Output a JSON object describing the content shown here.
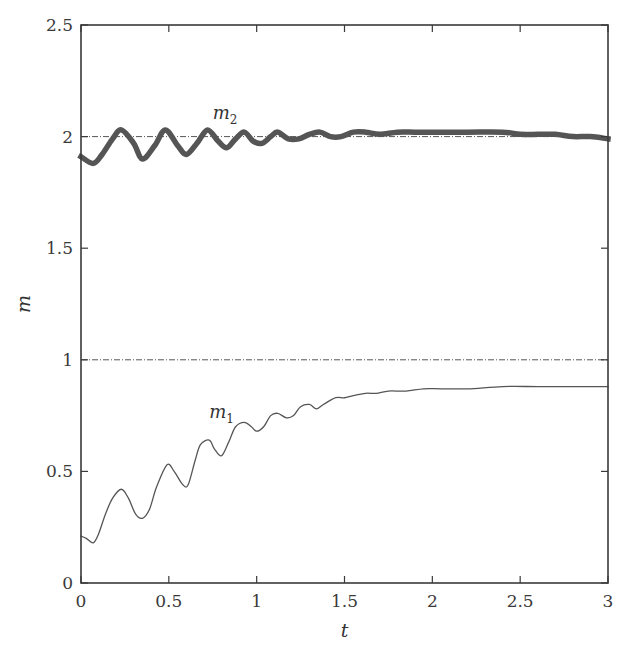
{
  "chart_data": {
    "type": "line",
    "title": "",
    "xlabel": "t",
    "ylabel": "m",
    "xlim": [
      0,
      3
    ],
    "ylim": [
      0,
      2.5
    ],
    "xticks": [
      0,
      0.5,
      1,
      1.5,
      2,
      2.5,
      3
    ],
    "xtick_labels": [
      "0",
      "0.5",
      "1",
      "1.5",
      "2",
      "2.5",
      "3"
    ],
    "yticks": [
      0,
      0.5,
      1,
      1.5,
      2,
      2.5
    ],
    "ytick_labels": [
      "0",
      "0.5",
      "1",
      "1.5",
      "2",
      "2.5"
    ],
    "grid": false,
    "legend": "none (inline series labels)",
    "reference_lines": [
      {
        "y": 2,
        "style": "dash-dot",
        "color": "#555555"
      },
      {
        "y": 1,
        "style": "dash-dot",
        "color": "#555555"
      }
    ],
    "series": [
      {
        "name": "m2",
        "label_main": "m",
        "label_sub": "2",
        "label_pos": {
          "t": 0.75,
          "m": 2.08
        },
        "style": "thick",
        "color": "#555555",
        "x": [
          0,
          0.07,
          0.12,
          0.18,
          0.23,
          0.3,
          0.35,
          0.42,
          0.48,
          0.55,
          0.6,
          0.66,
          0.72,
          0.78,
          0.83,
          0.88,
          0.93,
          0.98,
          1.03,
          1.08,
          1.12,
          1.18,
          1.24,
          1.3,
          1.36,
          1.42,
          1.48,
          1.55,
          1.62,
          1.7,
          1.8,
          1.9,
          2.0,
          2.2,
          2.4,
          2.5,
          2.6,
          2.7,
          2.8,
          2.9,
          3.0
        ],
        "values": [
          1.91,
          1.88,
          1.92,
          1.99,
          2.03,
          1.97,
          1.9,
          1.96,
          2.03,
          1.96,
          1.92,
          1.97,
          2.03,
          1.98,
          1.95,
          1.99,
          2.02,
          1.98,
          1.97,
          2.0,
          2.02,
          1.99,
          1.99,
          2.01,
          2.02,
          2.0,
          2.0,
          2.02,
          2.02,
          2.01,
          2.02,
          2.02,
          2.02,
          2.02,
          2.02,
          2.01,
          2.01,
          2.01,
          2.0,
          2.0,
          1.99
        ]
      },
      {
        "name": "m1",
        "label_main": "m",
        "label_sub": "1",
        "label_pos": {
          "t": 0.73,
          "m": 0.74
        },
        "style": "thin",
        "color": "#555555",
        "x": [
          0,
          0.03,
          0.07,
          0.1,
          0.14,
          0.18,
          0.23,
          0.27,
          0.31,
          0.35,
          0.39,
          0.43,
          0.49,
          0.53,
          0.58,
          0.61,
          0.65,
          0.68,
          0.73,
          0.76,
          0.8,
          0.84,
          0.88,
          0.93,
          0.97,
          1.0,
          1.04,
          1.08,
          1.12,
          1.17,
          1.21,
          1.25,
          1.3,
          1.34,
          1.38,
          1.45,
          1.5,
          1.55,
          1.62,
          1.68,
          1.75,
          1.85,
          1.95,
          2.05,
          2.2,
          2.4,
          2.6,
          2.8,
          3.0
        ],
        "values": [
          0.21,
          0.2,
          0.18,
          0.22,
          0.31,
          0.38,
          0.42,
          0.38,
          0.31,
          0.29,
          0.33,
          0.43,
          0.53,
          0.5,
          0.44,
          0.44,
          0.55,
          0.62,
          0.64,
          0.6,
          0.57,
          0.63,
          0.7,
          0.72,
          0.7,
          0.68,
          0.7,
          0.75,
          0.76,
          0.74,
          0.75,
          0.79,
          0.8,
          0.78,
          0.8,
          0.83,
          0.83,
          0.84,
          0.85,
          0.85,
          0.86,
          0.86,
          0.87,
          0.87,
          0.87,
          0.88,
          0.88,
          0.88,
          0.88
        ]
      }
    ]
  },
  "layout": {
    "plot_left": 81,
    "plot_right": 608,
    "plot_top": 25,
    "plot_bottom": 583
  }
}
